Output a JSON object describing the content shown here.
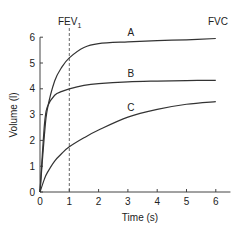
{
  "chart_data": {
    "type": "line",
    "title": "",
    "xlabel": "Time (s)",
    "ylabel": "Volume (l)",
    "xlim": [
      0,
      6.5
    ],
    "ylim": [
      0,
      6
    ],
    "xticks": [
      0,
      1,
      2,
      3,
      4,
      5,
      6
    ],
    "yticks": [
      0,
      1,
      2,
      3,
      4,
      5,
      6
    ],
    "grid": false,
    "legend": null,
    "annotations": [
      {
        "text": "FEV",
        "subscript": "1",
        "position": "top, above dashed line at x=1"
      },
      {
        "text": "FVC",
        "position": "top right, above x=6"
      }
    ],
    "reference_lines": [
      {
        "orientation": "vertical",
        "x": 1,
        "style": "dashed",
        "label": "FEV1"
      }
    ],
    "x": [
      0,
      0.15,
      0.25,
      0.5,
      0.75,
      1,
      1.5,
      2,
      3,
      4,
      5,
      6
    ],
    "series": [
      {
        "name": "A",
        "values": [
          0,
          2.2,
          3.2,
          4.3,
          4.85,
          5.2,
          5.6,
          5.75,
          5.82,
          5.87,
          5.9,
          5.95
        ]
      },
      {
        "name": "B",
        "values": [
          0,
          2.6,
          3.3,
          3.75,
          3.9,
          4.0,
          4.13,
          4.2,
          4.27,
          4.3,
          4.32,
          4.33
        ]
      },
      {
        "name": "C",
        "values": [
          0,
          0.5,
          0.75,
          1.2,
          1.5,
          1.75,
          2.1,
          2.4,
          2.9,
          3.2,
          3.4,
          3.5
        ]
      }
    ],
    "series_labels": [
      {
        "name": "A",
        "x": 3.1,
        "y": 6.05
      },
      {
        "name": "B",
        "x": 3.1,
        "y": 4.45
      },
      {
        "name": "C",
        "x": 3.1,
        "y": 3.15
      }
    ]
  },
  "labels": {
    "fev_main": "FEV",
    "fev_sub": "1",
    "fvc": "FVC",
    "xlabel": "Time (s)",
    "ylabel": "Volume (l)"
  }
}
